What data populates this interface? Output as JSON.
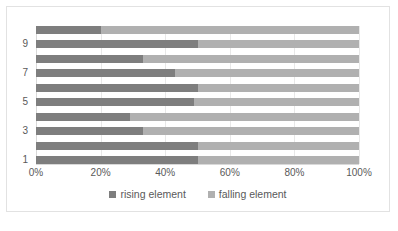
{
  "chart_data": {
    "type": "bar",
    "orientation": "horizontal",
    "stacked": true,
    "normalized": true,
    "title": "",
    "xlabel": "",
    "ylabel": "",
    "xlim": [
      0,
      100
    ],
    "xticks": [
      "0%",
      "20%",
      "40%",
      "60%",
      "80%",
      "100%"
    ],
    "xtick_values": [
      0,
      20,
      40,
      60,
      80,
      100
    ],
    "grid": true,
    "legend_position": "bottom",
    "categories": [
      "1",
      "2",
      "3",
      "4",
      "5",
      "6",
      "7",
      "8",
      "9",
      "10"
    ],
    "visible_ytick_labels": [
      "1",
      "3",
      "5",
      "7",
      "9"
    ],
    "series": [
      {
        "name": "rising element",
        "color": "#7e7e7e",
        "values": [
          50,
          50,
          33,
          29,
          49,
          50,
          43,
          33,
          50,
          20
        ]
      },
      {
        "name": "falling element",
        "color": "#b0b0b0",
        "values": [
          50,
          50,
          67,
          71,
          51,
          50,
          57,
          67,
          50,
          80
        ]
      }
    ]
  },
  "legend": {
    "items": [
      {
        "label": "rising element",
        "color": "#7e7e7e"
      },
      {
        "label": "falling element",
        "color": "#b0b0b0"
      }
    ]
  },
  "colors": {
    "rising": "#7e7e7e",
    "falling": "#b0b0b0",
    "gridline": "#e8e8e8",
    "axis_text": "#595959",
    "frame_border": "#e2e2e2",
    "background": "#ffffff"
  }
}
